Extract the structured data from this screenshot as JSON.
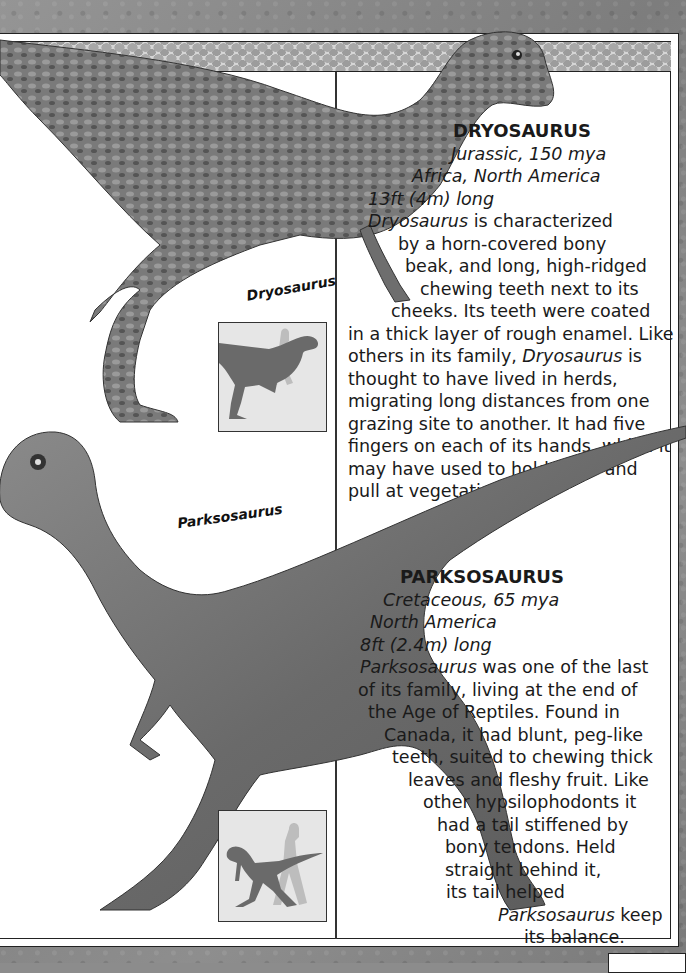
{
  "page": {
    "background_color": "#8c8c8c",
    "frame_color": "#ffffff",
    "line_color": "#222222"
  },
  "dryosaurus": {
    "illustration_label": "Dryosaurus",
    "heading": "DRYOSAURUS",
    "period": "Jurassic, 150 mya",
    "location": "Africa, North America",
    "length": "13ft (4m) long",
    "body_lines": [
      {
        "pre": "",
        "em": "Dryosaurus",
        "post": " is characterized"
      },
      {
        "pre": "by a horn-covered bony",
        "em": "",
        "post": ""
      },
      {
        "pre": "beak, and long, high-ridged",
        "em": "",
        "post": ""
      },
      {
        "pre": "chewing teeth next to its",
        "em": "",
        "post": ""
      },
      {
        "pre": "cheeks. Its teeth were coated",
        "em": "",
        "post": ""
      },
      {
        "pre": "in a thick layer of rough enamel. Like",
        "em": "",
        "post": ""
      },
      {
        "pre": "others in its family, ",
        "em": "Dryosaurus",
        "post": " is"
      },
      {
        "pre": "thought to have lived in herds,",
        "em": "",
        "post": ""
      },
      {
        "pre": "migrating long distances from one",
        "em": "",
        "post": ""
      },
      {
        "pre": "grazing site to another. It had five",
        "em": "",
        "post": ""
      },
      {
        "pre": "fingers on each of its hands, which it",
        "em": "",
        "post": ""
      },
      {
        "pre": "may have used to hold on to and",
        "em": "",
        "post": ""
      },
      {
        "pre": "pull at vegetation.",
        "em": "",
        "post": ""
      }
    ],
    "scale_icon": "dinosaur-human-scale-silhouette"
  },
  "parksosaurus": {
    "illustration_label": "Parksosaurus",
    "heading": "PARKSOSAURUS",
    "period": "Cretaceous, 65 mya",
    "location": "North America",
    "length": "8ft (2.4m) long",
    "body_lines": [
      {
        "pre": "",
        "em": "Parksosaurus",
        "post": " was one of the last"
      },
      {
        "pre": "of its family, living at the end of",
        "em": "",
        "post": ""
      },
      {
        "pre": "the Age of Reptiles. Found in",
        "em": "",
        "post": ""
      },
      {
        "pre": "Canada, it had blunt, peg-like",
        "em": "",
        "post": ""
      },
      {
        "pre": "teeth, suited to chewing thick",
        "em": "",
        "post": ""
      },
      {
        "pre": "leaves and fleshy fruit. Like",
        "em": "",
        "post": ""
      },
      {
        "pre": "other hypsilophodonts it",
        "em": "",
        "post": ""
      },
      {
        "pre": "had a tail stiffened by",
        "em": "",
        "post": ""
      },
      {
        "pre": "bony tendons. Held",
        "em": "",
        "post": ""
      },
      {
        "pre": "straight behind it,",
        "em": "",
        "post": ""
      },
      {
        "pre": "its tail helped",
        "em": "",
        "post": ""
      },
      {
        "pre": "",
        "em": "Parksosaurus",
        "post": " keep"
      },
      {
        "pre": "its balance.",
        "em": "",
        "post": ""
      }
    ],
    "scale_icon": "dinosaur-human-scale-silhouette"
  }
}
